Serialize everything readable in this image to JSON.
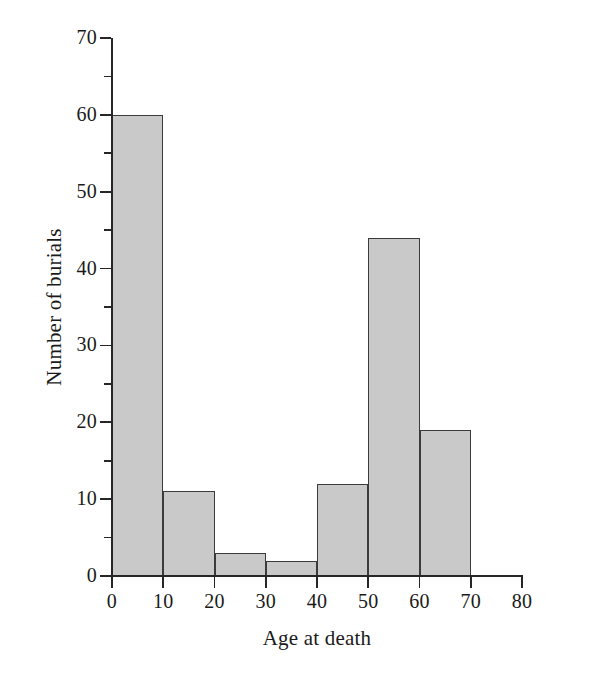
{
  "chart_data": {
    "type": "bar",
    "title": "",
    "subtitle": "",
    "xlabel": "Age at death",
    "ylabel": "Number of burials",
    "categories": [
      "0-10",
      "10-20",
      "20-30",
      "30-40",
      "40-50",
      "50-60",
      "60-70"
    ],
    "bin_edges": [
      0,
      10,
      20,
      30,
      40,
      50,
      60,
      70
    ],
    "values": [
      60,
      11,
      3,
      2,
      12,
      44,
      19
    ],
    "series": [
      {
        "name": "Number of burials",
        "values": [
          60,
          11,
          3,
          2,
          12,
          44,
          19
        ]
      }
    ],
    "xlim": [
      0,
      80
    ],
    "ylim": [
      0,
      70
    ],
    "x_ticks": [
      0,
      10,
      20,
      30,
      40,
      50,
      60,
      70,
      80
    ],
    "x_tick_labels": [
      "0",
      "10",
      "20",
      "30",
      "40",
      "50",
      "60",
      "70",
      "80"
    ],
    "y_ticks": [
      0,
      10,
      20,
      30,
      40,
      50,
      60,
      70
    ],
    "y_tick_labels": [
      "0",
      "10",
      "20",
      "30",
      "40",
      "50",
      "60",
      "70"
    ],
    "y_minor_ticks": [
      5,
      15,
      25,
      35,
      45,
      55,
      65
    ],
    "grid": false,
    "legend": false,
    "legend_position": "none",
    "bar_fill_color": "#c9c9c9",
    "bar_edge_color": "#3b3b3b",
    "axis_color": "#262626",
    "background_color": "#ffffff",
    "annotations": []
  }
}
